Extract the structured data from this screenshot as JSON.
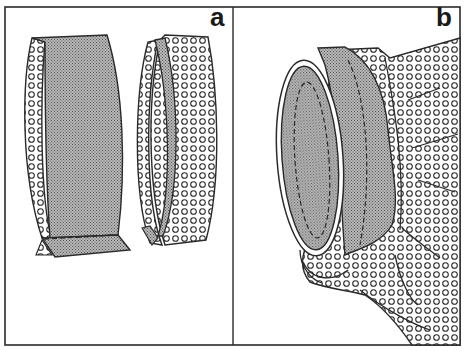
{
  "figure": {
    "panels": [
      {
        "id": "a",
        "label": "a"
      },
      {
        "id": "b",
        "label": "b"
      }
    ],
    "colors": {
      "line": "#2a2a2a",
      "stipple_fill": "#9a9a9a",
      "dot_fabric_bg": "#ffffff",
      "background": "#ffffff"
    }
  }
}
